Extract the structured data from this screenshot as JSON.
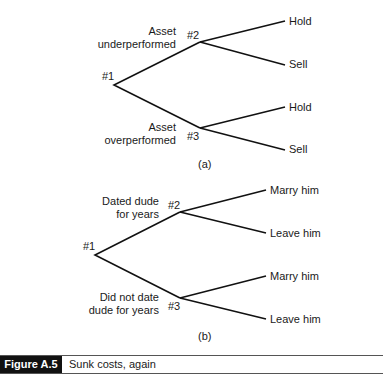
{
  "tree_a": {
    "root_label": "#1",
    "node2_label": "#2",
    "node3_label": "#3",
    "upper_branch": [
      "Asset",
      "underperformed"
    ],
    "lower_branch": [
      "Asset",
      "overperformed"
    ],
    "leaves": [
      "Hold",
      "Sell",
      "Hold",
      "Sell"
    ],
    "sublabel": "(a)"
  },
  "tree_b": {
    "root_label": "#1",
    "node2_label": "#2",
    "node3_label": "#3",
    "upper_branch": [
      "Dated dude",
      "for years"
    ],
    "lower_branch": [
      "Did not date",
      "dude for years"
    ],
    "leaves": [
      "Marry him",
      "Leave him",
      "Marry him",
      "Leave him"
    ],
    "sublabel": "(b)"
  },
  "caption": {
    "number": "Figure A.5",
    "title": "Sunk costs, again"
  }
}
